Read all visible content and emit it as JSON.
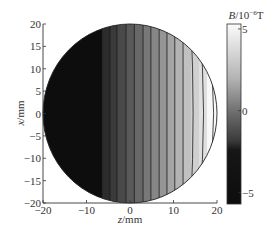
{
  "chart_data": {
    "type": "heatmap",
    "subtype": "filled-contour",
    "title": "",
    "xlabel": "z/mm",
    "ylabel": "x/mm",
    "xlim": [
      -20,
      20
    ],
    "ylim": [
      -20,
      20
    ],
    "x_ticks": [
      -20,
      -10,
      0,
      10,
      20
    ],
    "y_ticks": [
      -20,
      -15,
      -10,
      -5,
      0,
      5,
      10,
      15,
      20
    ],
    "x_tick_labels": [
      "−20",
      "−10",
      "0",
      "10",
      "20"
    ],
    "y_tick_labels": [
      "−20",
      "−15",
      "−10",
      "−5",
      "0",
      "5",
      "10",
      "15",
      "20"
    ],
    "domain": {
      "shape": "circle",
      "center": [
        0,
        0
      ],
      "radius": 20
    },
    "grid": false,
    "colorbar": {
      "label": "B/10",
      "label_exponent": "−6",
      "label_unit": "T",
      "ticks": [
        5,
        0,
        -5
      ],
      "tick_labels": [
        "5",
        "0",
        "−5"
      ],
      "range": [
        -5.7,
        5.3
      ],
      "colormap": "gray",
      "position": "right"
    },
    "contour_levels_z_mm": [
      -6.4,
      -4.6,
      -3.0,
      -0.9,
      1.0,
      3.0,
      4.8,
      6.7,
      8.5,
      10.3,
      12.2,
      14.0,
      15.9,
      17.7
    ],
    "field_description": "B varies roughly linearly with z; minimum (~ -5.7) for z < -6.4 mm, increasing to ~5 at z = 20 mm; contour lines are nearly vertical, with the rightmost contours curving as arcs."
  }
}
